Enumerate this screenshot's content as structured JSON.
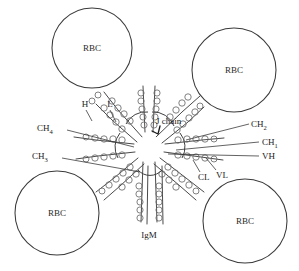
{
  "figure": {
    "background_color": "#ffffff",
    "line_color": "#3a3a3a",
    "text_color": "#1a1a1a",
    "width": 299,
    "height": 271
  },
  "cells": [
    {
      "label": "RBC",
      "position": "top-left",
      "cx": 92,
      "cy": 48,
      "r": 40
    },
    {
      "label": "RBC",
      "position": "top-right",
      "cx": 234,
      "cy": 70,
      "r": 42
    },
    {
      "label": "RBC",
      "position": "bottom-left",
      "cx": 57,
      "cy": 213,
      "r": 42
    },
    {
      "label": "RBC",
      "position": "bottom-right",
      "cx": 245,
      "cy": 221,
      "r": 42
    }
  ],
  "annotations": [
    {
      "id": "H",
      "text": "H",
      "sub": "",
      "x": 85,
      "y": 107,
      "align": "middle"
    },
    {
      "id": "L",
      "text": "L",
      "sub": "",
      "x": 110,
      "y": 107,
      "align": "middle"
    },
    {
      "id": "J-chain",
      "text": "J chain",
      "sub": "",
      "x": 156,
      "y": 124,
      "align": "start"
    },
    {
      "id": "CH4",
      "text": "CH",
      "sub": "4",
      "x": 37,
      "y": 131,
      "align": "start"
    },
    {
      "id": "CH3",
      "text": "CH",
      "sub": "3",
      "x": 32,
      "y": 159,
      "align": "start"
    },
    {
      "id": "CH2",
      "text": "CH",
      "sub": "2",
      "x": 251,
      "y": 127,
      "align": "start"
    },
    {
      "id": "CH1",
      "text": "CH",
      "sub": "1",
      "x": 262,
      "y": 145,
      "align": "start"
    },
    {
      "id": "VH",
      "text": "VH",
      "sub": "",
      "x": 262,
      "y": 159,
      "align": "start"
    },
    {
      "id": "CL",
      "text": "CL",
      "sub": "",
      "x": 198,
      "y": 180,
      "align": "start"
    },
    {
      "id": "VL",
      "text": "VL",
      "sub": "",
      "x": 216,
      "y": 178,
      "align": "start"
    },
    {
      "id": "IgM",
      "text": "IgM",
      "sub": "",
      "x": 149,
      "y": 238,
      "align": "middle"
    }
  ],
  "structure": {
    "hub": {
      "cx": 149,
      "cy": 146,
      "r": 17
    },
    "arm_count": 5,
    "arm_angles_deg": [
      -135,
      -45,
      180,
      0,
      90
    ],
    "description": "Pentameric IgM with five Y-shaped monomer units radiating from a central J-chain hub"
  }
}
